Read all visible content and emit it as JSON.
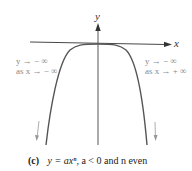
{
  "figure": {
    "axes": {
      "x_label": "x",
      "y_label": "y"
    },
    "annotations": {
      "left": {
        "line1": "y → − ∞",
        "line2": "as x → − ∞"
      },
      "right": {
        "line1": "y → − ∞",
        "line2": "as x → + ∞"
      }
    },
    "caption": {
      "tag": "(c)",
      "equation": "y = axⁿ,",
      "condition": "a < 0 and n even"
    },
    "colors": {
      "curve": "#555555",
      "axis": "#333333",
      "annotation": "#8a8a8a"
    }
  }
}
